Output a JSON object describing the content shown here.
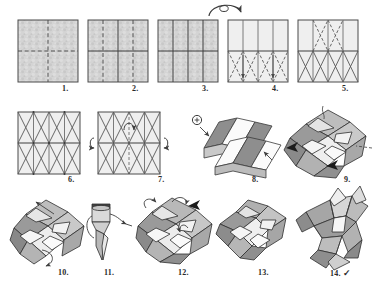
{
  "document": {
    "kind": "origami-instruction-diagram",
    "title": "Modular Origami Star Folding Sequence",
    "background_color": "#ffffff",
    "line_color": "#3a3a3a",
    "paper_fill": "#d2d2d2",
    "paper_fill_light": "#eeeeee",
    "facet_dark": "#8e8e8e",
    "facet_mid": "#b4b4b4",
    "facet_light": "#e8e8e8",
    "facet_white": "#fbfbfb",
    "arrow_color": "#4a4a4a",
    "total_steps": 14,
    "rows": 3
  },
  "steps": [
    {
      "number": "1.",
      "label_x": 62,
      "label_y": 84,
      "kind": "flat-square-creases",
      "description": "Square sheet, textured side up, with vertical and horizontal center valley creases",
      "panel": {
        "x": 18,
        "y": 20,
        "w": 60,
        "h": 62
      },
      "cols": 2,
      "rows": 2,
      "fill": "textured",
      "diagonals": "none"
    },
    {
      "number": "2.",
      "label_x": 132,
      "label_y": 84,
      "kind": "flat-square-creases",
      "description": "Quarter vertical creases added, four columns and two rows",
      "panel": {
        "x": 88,
        "y": 20,
        "w": 60,
        "h": 62
      },
      "cols": 4,
      "rows": 2,
      "fill": "textured",
      "diagonals": "none"
    },
    {
      "number": "3.",
      "label_x": 202,
      "label_y": 84,
      "kind": "flat-square-creases",
      "description": "All creases sharpened, ready to turn the paper over",
      "panel": {
        "x": 158,
        "y": 20,
        "w": 60,
        "h": 62
      },
      "cols": 4,
      "rows": 2,
      "fill": "textured",
      "diagonals": "none"
    },
    {
      "number": "4.",
      "label_x": 272,
      "label_y": 84,
      "kind": "flat-square-creases",
      "description": "White side up; diagonal creases folded in the lower band only",
      "panel": {
        "x": 228,
        "y": 20,
        "w": 60,
        "h": 62
      },
      "cols": 4,
      "rows": 2,
      "fill": "plain",
      "diagonals": "bottom-band"
    },
    {
      "number": "5.",
      "label_x": 342,
      "label_y": 84,
      "kind": "flat-square-creases",
      "description": "Diagonal creases completed across both bands of the grid",
      "panel": {
        "x": 298,
        "y": 20,
        "w": 60,
        "h": 62
      },
      "cols": 4,
      "rows": 2,
      "fill": "plain",
      "diagonals": "all"
    },
    {
      "number": "6.",
      "label_x": 68,
      "label_y": 175,
      "kind": "flat-square-creases",
      "description": "Full crease pattern, all mountain and valley folds precreased",
      "panel": {
        "x": 18,
        "y": 112,
        "w": 62,
        "h": 62
      },
      "cols": 4,
      "rows": 2,
      "fill": "plain",
      "diagonals": "all"
    },
    {
      "number": "7.",
      "label_x": 158,
      "label_y": 175,
      "kind": "collapse-square",
      "description": "Begin collapsing the grid, pushing the sides inward along the center band",
      "panel": {
        "x": 98,
        "y": 112,
        "w": 62,
        "h": 62
      },
      "cols": 4,
      "rows": 2,
      "fill": "plain",
      "diagonals": "all"
    },
    {
      "number": "8.",
      "label_x": 252,
      "label_y": 175,
      "kind": "corrugation-3d",
      "description": "Three dimensional corrugated zig-zag of alternating dark and white facets",
      "panel": {
        "x": 192,
        "y": 108,
        "w": 78,
        "h": 64
      }
    },
    {
      "number": "9.",
      "label_x": 344,
      "label_y": 175,
      "kind": "star-collapse",
      "description": "Corrugation pressed flat into an eight point star arrangement",
      "panel": {
        "x": 288,
        "y": 106,
        "w": 80,
        "h": 70
      }
    },
    {
      "number": "10.",
      "label_x": 58,
      "label_y": 268,
      "kind": "star-collapse",
      "description": "Lift and rotate a point; rotation arrow indicates turning the model",
      "panel": {
        "x": 12,
        "y": 198,
        "w": 72,
        "h": 66
      }
    },
    {
      "number": "11.",
      "label_x": 104,
      "label_y": 268,
      "kind": "point-detail",
      "description": "Close up of a single point being wrapped and tucked into itself",
      "panel": {
        "x": 88,
        "y": 200,
        "w": 32,
        "h": 62
      }
    },
    {
      "number": "12.",
      "label_x": 178,
      "label_y": 268,
      "kind": "star-collapse",
      "description": "All points tucked; shape tightened into a faceted star body",
      "panel": {
        "x": 136,
        "y": 196,
        "w": 76,
        "h": 68
      }
    },
    {
      "number": "13.",
      "label_x": 258,
      "label_y": 268,
      "kind": "star-collapse",
      "description": "Star body shaped, ready to pull the spikes outward",
      "panel": {
        "x": 218,
        "y": 198,
        "w": 72,
        "h": 64
      }
    },
    {
      "number": "14.",
      "label_x": 330,
      "label_y": 268,
      "kind": "finished-star",
      "completed_mark": "✓",
      "description": "Finished three dimensional origami star with sharp raised spikes",
      "panel": {
        "x": 296,
        "y": 194,
        "w": 76,
        "h": 70
      }
    }
  ],
  "symbols": {
    "turn_over_arrow": {
      "name": "turn-over-arrow",
      "x": 206,
      "y": 4,
      "w": 40,
      "h": 16,
      "meaning": "turn the paper over"
    },
    "rotate_arrow_step8": {
      "name": "rotate-symbol",
      "x": 196,
      "y": 110,
      "meaning": "rotate / view direction"
    },
    "completed_check": "✓"
  }
}
